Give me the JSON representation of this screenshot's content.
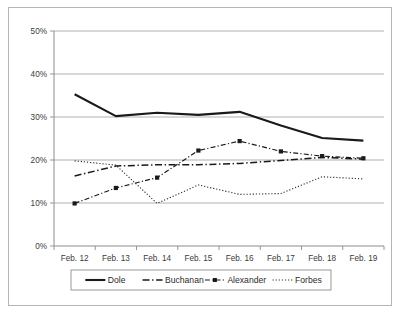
{
  "chart_data": {
    "type": "line",
    "title": "",
    "subtitle": "",
    "xlabel": "",
    "ylabel": "",
    "categories": [
      "Feb. 12",
      "Feb. 13",
      "Feb. 14",
      "Feb. 15",
      "Feb. 16",
      "Feb. 17",
      "Feb. 18",
      "Feb. 19"
    ],
    "ylim": [
      0,
      50
    ],
    "y_ticks": [
      0,
      10,
      20,
      30,
      40,
      50
    ],
    "y_tick_labels": [
      "0%",
      "10%",
      "20%",
      "30%",
      "40%",
      "50%"
    ],
    "x_tick_labels": [
      "Feb. 12",
      "Feb. 13",
      "Feb. 14",
      "Feb. 15",
      "Feb. 16",
      "Feb. 17",
      "Feb. 18",
      "Feb. 19"
    ],
    "grid": "horizontal",
    "legend_position": "bottom",
    "units": "percent",
    "series": [
      {
        "name": "Dole",
        "values": [
          35.3,
          30.2,
          31.0,
          30.5,
          31.2,
          28.0,
          25.1,
          24.5
        ],
        "style": "solid",
        "color": "#1a1a1a",
        "markers": false,
        "width": 2.1
      },
      {
        "name": "Buchanan",
        "values": [
          16.3,
          18.6,
          18.9,
          18.9,
          19.2,
          19.9,
          20.6,
          20.2
        ],
        "style": "dash-dot",
        "color": "#1a1a1a",
        "markers": false,
        "width": 1.5
      },
      {
        "name": "Alexander",
        "values": [
          9.9,
          13.5,
          15.9,
          22.2,
          24.4,
          22.0,
          20.9,
          20.4
        ],
        "style": "dash-dot-marker",
        "color": "#1a1a1a",
        "markers": true,
        "width": 1.2
      },
      {
        "name": "Forbes",
        "values": [
          19.8,
          18.8,
          9.9,
          14.2,
          12.0,
          12.2,
          16.1,
          15.6
        ],
        "style": "dotted",
        "color": "#2b2b2b",
        "markers": false,
        "width": 1.1
      }
    ],
    "legend_entries": [
      {
        "label": "Dole",
        "style": "solid"
      },
      {
        "label": "Buchanan",
        "style": "dash-dot"
      },
      {
        "label": "Alexander",
        "style": "dash-dot-marker"
      },
      {
        "label": "Forbes",
        "style": "dotted"
      }
    ]
  }
}
